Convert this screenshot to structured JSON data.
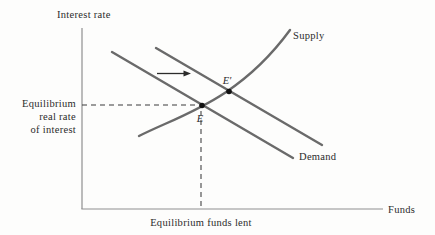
{
  "figure": {
    "kind": "supply-demand-diagram",
    "axes": {
      "y_label": "Interest rate",
      "x_label": "Funds"
    },
    "curves": {
      "supply_label": "Supply",
      "demand_label": "Demand"
    },
    "points": {
      "initial_equilibrium_label": "E",
      "new_equilibrium_label": "E′"
    },
    "annotations": {
      "y_equilibrium_lines": [
        "Equilibrium",
        "real rate",
        "of interest"
      ],
      "x_equilibrium_label": "Equilibrium funds lent",
      "shift_arrow_direction": "right"
    },
    "colors": {
      "background": "#fdfdfc",
      "curve": "#6a6a6a",
      "axis": "#8f8f8f",
      "text": "#2b2b2b",
      "point": "#111111",
      "dashed": "#3b3b3b"
    }
  }
}
